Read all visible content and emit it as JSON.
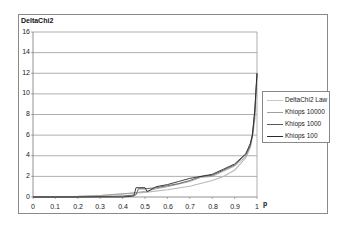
{
  "chart_data": {
    "type": "line",
    "title": "DeltaChi2",
    "xlabel": "p",
    "ylabel": "",
    "xlim": [
      0,
      1
    ],
    "ylim": [
      0,
      16
    ],
    "x_ticks": [
      "0",
      "0.1",
      "0.2",
      "0.3",
      "0.4",
      "0.5",
      "0.6",
      "0.7",
      "0.8",
      "0.9",
      "1"
    ],
    "y_ticks": [
      "0",
      "2",
      "4",
      "6",
      "8",
      "10",
      "12",
      "14",
      "16"
    ],
    "grid": "horizontal",
    "legend_position": "right",
    "series": [
      {
        "name": "DeltaChi2 Law",
        "color": "#b8b8b8",
        "x": [
          0,
          0.1,
          0.2,
          0.3,
          0.4,
          0.5,
          0.6,
          0.7,
          0.8,
          0.85,
          0.9,
          0.95,
          0.97,
          0.98,
          0.99,
          0.995,
          1.0
        ],
        "y": [
          0,
          0.02,
          0.06,
          0.15,
          0.3,
          0.45,
          0.7,
          1.05,
          1.6,
          2.0,
          2.6,
          3.8,
          4.8,
          5.8,
          7.5,
          9.5,
          12
        ]
      },
      {
        "name": "Khiops 10000",
        "color": "#a0a0a0",
        "x": [
          0,
          0.1,
          0.2,
          0.3,
          0.4,
          0.45,
          0.5,
          0.55,
          0.6,
          0.7,
          0.75,
          0.8,
          0.85,
          0.9,
          0.95,
          0.97,
          0.98,
          0.99,
          1.0
        ],
        "y": [
          0,
          0.02,
          0.06,
          0.15,
          0.3,
          0.4,
          0.55,
          0.8,
          1.0,
          1.5,
          1.9,
          2.0,
          2.5,
          3.0,
          3.9,
          4.9,
          6.0,
          8.0,
          12
        ]
      },
      {
        "name": "Khiops 1000",
        "color": "#5a5a5a",
        "x": [
          0,
          0.1,
          0.2,
          0.3,
          0.4,
          0.46,
          0.47,
          0.5,
          0.55,
          0.6,
          0.65,
          0.7,
          0.75,
          0.8,
          0.85,
          0.9,
          0.95,
          0.97,
          0.98,
          0.99,
          1.0
        ],
        "y": [
          0,
          0,
          0,
          0.05,
          0.1,
          0.2,
          0.8,
          0.8,
          0.9,
          1.1,
          1.3,
          1.6,
          2.0,
          2.1,
          2.6,
          3.1,
          4.1,
          5.0,
          6.2,
          8.2,
          12
        ]
      },
      {
        "name": "Khiops 100",
        "color": "#2a2a2a",
        "x": [
          0,
          0.1,
          0.2,
          0.3,
          0.4,
          0.45,
          0.46,
          0.5,
          0.51,
          0.55,
          0.6,
          0.65,
          0.7,
          0.75,
          0.8,
          0.85,
          0.9,
          0.95,
          0.97,
          0.98,
          0.99,
          1.0
        ],
        "y": [
          0,
          0,
          0,
          0,
          0,
          0.1,
          0.9,
          0.9,
          0.5,
          1.0,
          1.2,
          1.5,
          1.8,
          2.0,
          2.2,
          2.7,
          3.2,
          4.2,
          5.2,
          6.0,
          8.5,
          12
        ]
      }
    ]
  },
  "chart": {
    "title": "DeltaChi2",
    "xlabel": "p",
    "y_ticks": [
      "16",
      "14",
      "12",
      "10",
      "8",
      "6",
      "4",
      "2",
      "0"
    ],
    "x_ticks": [
      "0",
      "0.1",
      "0.2",
      "0.3",
      "0.4",
      "0.5",
      "0.6",
      "0.7",
      "0.8",
      "0.9",
      "1"
    ],
    "legend": [
      "DeltaChi2 Law",
      "Khiops 10000",
      "Khiops 1000",
      "Khiops 100"
    ]
  }
}
